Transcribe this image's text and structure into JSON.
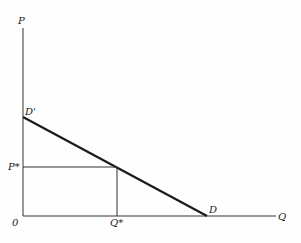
{
  "diagram": {
    "axes": {
      "y_label": "P",
      "x_label": "Q",
      "origin_label": "0"
    },
    "demand_curve": {
      "start_label": "D'",
      "end_label": "D"
    },
    "equilibrium": {
      "price_label": "P*",
      "quantity_label": "Q*"
    },
    "colors": {
      "line": "#222222",
      "background": "#fefefe"
    }
  }
}
